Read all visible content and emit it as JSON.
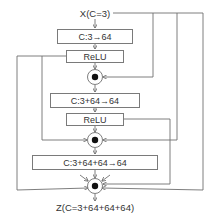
{
  "diagram": {
    "input_label": "X(C=3)",
    "output_label": "Z(C=3+64+64+64)",
    "blocks": [
      {
        "label": "C:3→64"
      },
      {
        "label": "ReLU"
      },
      {
        "label": "C:3+64→64"
      },
      {
        "label": "ReLU"
      },
      {
        "label": "C:3+64+64→64"
      }
    ],
    "merge_nodes": [
      {
        "symbol": "concat"
      },
      {
        "symbol": "concat"
      },
      {
        "symbol": "concat"
      }
    ],
    "colors": {
      "line": "#6f6f6f",
      "box_border": "#7a7a7a",
      "text": "#333333",
      "dot": "#111111"
    }
  }
}
